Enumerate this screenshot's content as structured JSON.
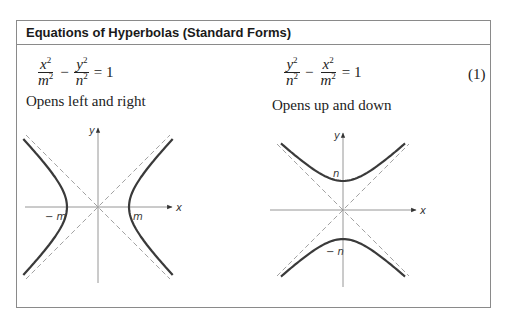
{
  "header": {
    "title": "Equations of Hyperbolas (Standard Forms)"
  },
  "equation_number": "(1)",
  "left": {
    "equation": {
      "term1": {
        "num_var": "x",
        "den_var": "m",
        "power": "2"
      },
      "operator": "−",
      "term2": {
        "num_var": "y",
        "den_var": "n",
        "power": "2"
      },
      "rhs": "= 1"
    },
    "caption": "Opens left and right",
    "graph": {
      "orientation": "horizontal",
      "axis_labels": {
        "x": "x",
        "y": "y"
      },
      "vertex_labels": {
        "negative": "− m",
        "positive": "m"
      },
      "origin": [
        98,
        207
      ],
      "a_px": 31,
      "b_px": 31,
      "x_extent": [
        25,
        172
      ],
      "y_extent": [
        128,
        283
      ],
      "curve_span": 68,
      "colors": {
        "curve": "#3a3a3a",
        "axis": "#8a8a8a",
        "asymptote": "#8a8a8a"
      }
    }
  },
  "right": {
    "equation": {
      "term1": {
        "num_var": "y",
        "den_var": "n",
        "power": "2"
      },
      "operator": "−",
      "term2": {
        "num_var": "x",
        "den_var": "m",
        "power": "2"
      },
      "rhs": "= 1"
    },
    "caption": "Opens up and down",
    "graph": {
      "orientation": "vertical",
      "axis_labels": {
        "x": "x",
        "y": "y"
      },
      "vertex_labels": {
        "negative": "− n",
        "positive": "n"
      },
      "origin": [
        343,
        210
      ],
      "a_px": 29,
      "b_px": 30,
      "x_extent": [
        270,
        416
      ],
      "y_extent": [
        133,
        287
      ],
      "curve_span": 62,
      "colors": {
        "curve": "#3a3a3a",
        "axis": "#8a8a8a",
        "asymptote": "#8a8a8a"
      }
    }
  }
}
